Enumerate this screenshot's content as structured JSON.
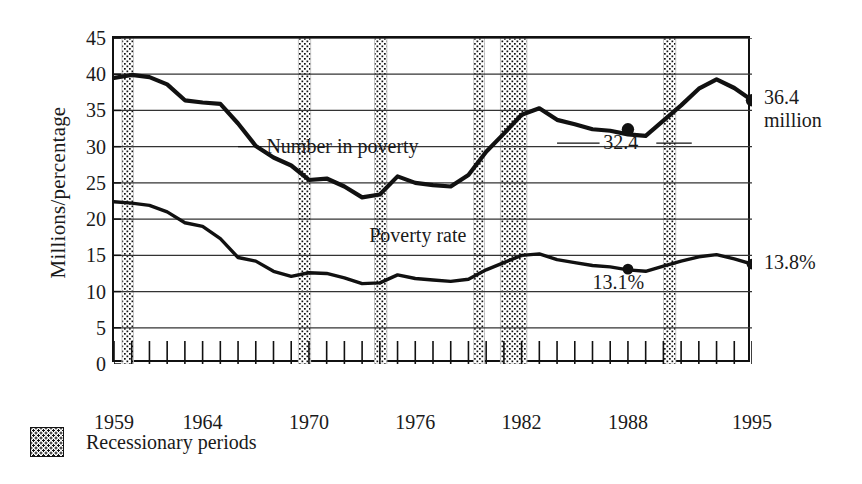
{
  "chart_data": {
    "type": "line",
    "title": "",
    "xlabel": "",
    "ylabel": "Millions/percentage",
    "ylim": [
      0,
      45
    ],
    "ytick_values": [
      0,
      5,
      10,
      15,
      20,
      25,
      30,
      35,
      40,
      45
    ],
    "ytick_labels": [
      "0",
      "5",
      "10",
      "15",
      "20",
      "25",
      "30",
      "35",
      "40",
      "45"
    ],
    "xlim": [
      1959,
      1995
    ],
    "xtick_labels": [
      "1959",
      "1964",
      "1970",
      "1976",
      "1982",
      "1988",
      "1995"
    ],
    "xtick_values": [
      1959,
      1964,
      1970,
      1976,
      1982,
      1988,
      1995
    ],
    "minor_xticks": "every year 1959-1995",
    "grid": "horizontal gridlines at every 5 units",
    "legend_position": "below plot, left",
    "series": [
      {
        "name": "Number in poverty",
        "units": "millions",
        "inline_label": "Number in poverty",
        "x": [
          1959,
          1960,
          1961,
          1962,
          1963,
          1964,
          1965,
          1966,
          1967,
          1968,
          1969,
          1970,
          1971,
          1972,
          1973,
          1974,
          1975,
          1976,
          1977,
          1978,
          1979,
          1980,
          1981,
          1982,
          1983,
          1984,
          1985,
          1986,
          1987,
          1988,
          1989,
          1990,
          1991,
          1992,
          1993,
          1994,
          1995
        ],
        "values": [
          39.5,
          39.9,
          39.6,
          38.6,
          36.4,
          36.1,
          35.9,
          33.2,
          30.1,
          28.5,
          27.4,
          25.4,
          25.6,
          24.5,
          23.0,
          23.4,
          25.9,
          25.0,
          24.7,
          24.5,
          26.1,
          29.3,
          31.8,
          34.4,
          35.3,
          33.7,
          33.1,
          32.4,
          32.2,
          31.7,
          31.5,
          33.6,
          35.7,
          38.0,
          39.3,
          38.1,
          36.4
        ],
        "annotations": [
          {
            "text": "32.4",
            "x": 1988,
            "y": 30.5,
            "note": "callout for 1988 marker"
          },
          {
            "text": "36.4",
            "x": 1995,
            "y": 36.4,
            "note": "end value, line 1"
          },
          {
            "text": "million",
            "x": 1995,
            "y": 36.4,
            "note": "end value, line 2"
          }
        ],
        "markers": [
          {
            "x": 1988,
            "value": 32.4
          },
          {
            "x": 1995,
            "value": 36.4
          }
        ]
      },
      {
        "name": "Poverty rate",
        "units": "percent",
        "inline_label": "Poverty rate",
        "x": [
          1959,
          1960,
          1961,
          1962,
          1963,
          1964,
          1965,
          1966,
          1967,
          1968,
          1969,
          1970,
          1971,
          1972,
          1973,
          1974,
          1975,
          1976,
          1977,
          1978,
          1979,
          1980,
          1981,
          1982,
          1983,
          1984,
          1985,
          1986,
          1987,
          1988,
          1989,
          1990,
          1991,
          1992,
          1993,
          1994,
          1995
        ],
        "values": [
          22.4,
          22.2,
          21.9,
          21.0,
          19.5,
          19.0,
          17.3,
          14.7,
          14.2,
          12.8,
          12.1,
          12.6,
          12.5,
          11.9,
          11.1,
          11.2,
          12.3,
          11.8,
          11.6,
          11.4,
          11.7,
          13.0,
          14.0,
          15.0,
          15.2,
          14.4,
          14.0,
          13.6,
          13.4,
          13.0,
          12.8,
          13.5,
          14.2,
          14.8,
          15.1,
          14.5,
          13.8
        ],
        "annotations": [
          {
            "text": "13.1%",
            "x": 1988,
            "y": 11.0,
            "note": "callout for 1988 marker"
          },
          {
            "text": "13.8%",
            "x": 1995,
            "y": 13.8,
            "note": "end value"
          }
        ],
        "markers": [
          {
            "x": 1988,
            "value": 13.1
          },
          {
            "x": 1995,
            "value": 13.8
          }
        ]
      }
    ],
    "shaded_bands": {
      "label": "Recessionary periods",
      "fill": "dotted-stipple",
      "ranges": [
        {
          "start": 1959.45,
          "end": 1960.1
        },
        {
          "start": 1969.4,
          "end": 1970.1
        },
        {
          "start": 1973.7,
          "end": 1974.4
        },
        {
          "start": 1979.3,
          "end": 1979.9
        },
        {
          "start": 1980.8,
          "end": 1982.3
        },
        {
          "start": 1990.0,
          "end": 1990.7
        }
      ]
    },
    "colors": {
      "line": "#111111",
      "axis": "#111111",
      "gridline": "#333333",
      "band": "#111111",
      "background": "#ffffff"
    }
  },
  "legend": {
    "label": "Recessionary periods",
    "swatch_name": "recession-band-swatch"
  }
}
